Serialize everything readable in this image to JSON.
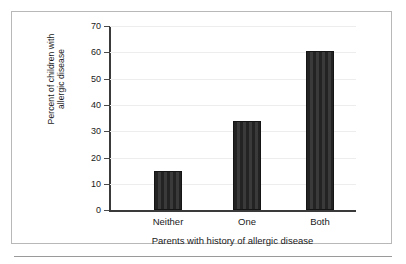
{
  "figure": {
    "frame_color": "#b8b8b8",
    "background": "#ffffff",
    "bar_color": "#2b2b2b",
    "gridline_color": "#ededed",
    "axis_color": "#3a3a3a"
  },
  "chart_data": {
    "type": "bar",
    "title": "",
    "subtitle": "",
    "xlabel": "Parents with history of allergic disease",
    "ylabel": "Percent of children with allergic disease",
    "ylabel_line1": "Percent of children with",
    "ylabel_line2": "allergic disease",
    "categories": [
      "Neither",
      "One",
      "Both"
    ],
    "values": [
      15,
      34,
      60.5
    ],
    "series": [
      {
        "name": "Percent of children with allergic disease",
        "values": [
          15,
          34,
          60.5
        ]
      }
    ],
    "ylim": [
      0,
      70
    ],
    "xlim": [
      0,
      3
    ],
    "yticks": [
      0,
      10,
      20,
      30,
      40,
      50,
      60,
      70
    ],
    "ytick_labels": [
      "0",
      "10",
      "20",
      "30",
      "40",
      "50",
      "60",
      "70"
    ],
    "grid": true,
    "grid_axis": "y",
    "legend": false,
    "legend_position": "none",
    "annotations": []
  }
}
